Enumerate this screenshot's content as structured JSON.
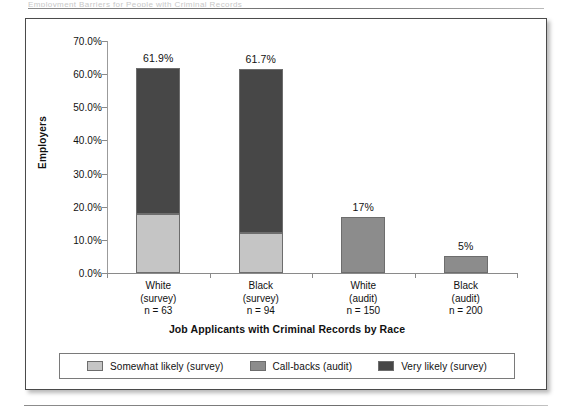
{
  "page": {
    "ghost_running_head": "Employment Barriers for People with Criminal Records"
  },
  "chart_data": {
    "type": "bar",
    "subtype": "stacked-bar",
    "title": "",
    "xlabel": "Job Applicants with Criminal Records by Race",
    "ylabel": "Employers",
    "categories": [
      {
        "line1": "White",
        "line2": "(survey)",
        "line3": "n = 63"
      },
      {
        "line1": "Black",
        "line2": "(survey)",
        "line3": "n = 94"
      },
      {
        "line1": "White",
        "line2": "(audit)",
        "line3": "n = 150"
      },
      {
        "line1": "Black",
        "line2": "(audit)",
        "line3": "n = 200"
      }
    ],
    "series": [
      {
        "name": "Somewhat likely (survey)",
        "color": "#c5c5c5",
        "values": [
          17.8,
          12.1,
          0,
          0
        ]
      },
      {
        "name": "Call-backs (audit)",
        "color": "#8c8c8c",
        "values": [
          0,
          0,
          17.0,
          5.0
        ]
      },
      {
        "name": "Very likely (survey)",
        "color": "#474747",
        "values": [
          44.1,
          49.6,
          0,
          0
        ]
      }
    ],
    "bar_totals": [
      61.9,
      61.7,
      17.0,
      5.0
    ],
    "bar_value_labels": [
      "61.9%",
      "61.7%",
      "17%",
      "5%"
    ],
    "ylim": [
      0,
      70
    ],
    "ytick_values": [
      70,
      60,
      50,
      40,
      30,
      20,
      10,
      0
    ],
    "ytick_labels": [
      "70.0%",
      "60.0%",
      "50.0%",
      "40.0%",
      "30.0%",
      "20.0%",
      "10.0%",
      "0.0%"
    ],
    "grid": false,
    "legend_position": "bottom",
    "legend": [
      {
        "label": "Somewhat likely (survey)",
        "color": "#c5c5c5"
      },
      {
        "label": "Call-backs (audit)",
        "color": "#8c8c8c"
      },
      {
        "label": "Very likely (survey)",
        "color": "#474747"
      }
    ]
  }
}
